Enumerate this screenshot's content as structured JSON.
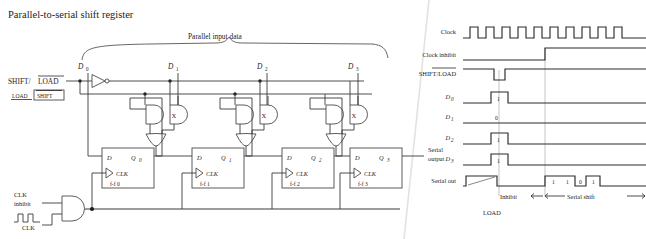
{
  "figure": {
    "title": "Parallel-to-serial shift register"
  },
  "circuit": {
    "parallel_bracket_label": "Parallel input data",
    "data_inputs": [
      {
        "name": "D",
        "sub": "0"
      },
      {
        "name": "D",
        "sub": "1"
      },
      {
        "name": "D",
        "sub": "2"
      },
      {
        "name": "D",
        "sub": "3"
      }
    ],
    "shift_load": {
      "label_shift": "SHIFT/",
      "label_load": "LOAD",
      "indicator_load": "LOAD",
      "indicator_shift": "SHIFT"
    },
    "xor_marker": "X",
    "flipflops": [
      {
        "d": "D",
        "q": "Q",
        "qsub": "0",
        "clk": "CLK",
        "name": "f-f  0"
      },
      {
        "d": "D",
        "q": "Q",
        "qsub": "1",
        "clk": "CLK",
        "name": "f-f  1"
      },
      {
        "d": "D",
        "q": "Q",
        "qsub": "2",
        "clk": "CLK",
        "name": "f-f  2"
      },
      {
        "d": "D",
        "q": "Q",
        "qsub": "3",
        "clk": "CLK",
        "name": "f-f  3"
      }
    ],
    "serial_output_line1": "Serial",
    "serial_output_line2": "output",
    "clock_inhibit_line1": "CLK",
    "clock_inhibit_line2": "inhibit",
    "clock_label": "CLK"
  },
  "timing": {
    "rows": [
      {
        "label": "Clock",
        "sub": ""
      },
      {
        "label": "Clock inhibit",
        "sub": ""
      },
      {
        "label": "SHIFT/LOAD",
        "sub": ""
      },
      {
        "label": "D",
        "sub": "0"
      },
      {
        "label": "D",
        "sub": "1"
      },
      {
        "label": "D",
        "sub": "2"
      },
      {
        "label": "D",
        "sub": "3"
      },
      {
        "label": "Serial out",
        "sub": ""
      }
    ],
    "bit_values": {
      "d0": "1",
      "d1": "0",
      "d2": "1",
      "d3": "1"
    },
    "serial_bits": [
      "1",
      "1",
      "0",
      "1"
    ],
    "annotations": {
      "inhibit": "Inhibit",
      "serial_shift": "Serial shift",
      "load": "LOAD"
    },
    "clock_pulse_count": 8
  },
  "colors": {
    "ink": "#1d1d1d",
    "wire": "#3a3a3a",
    "gate": "#4a4a4a",
    "background": "#ffffff"
  }
}
